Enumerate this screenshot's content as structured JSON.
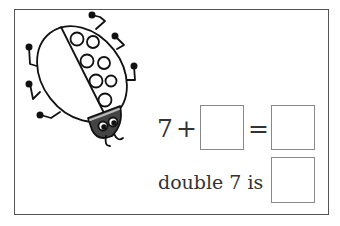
{
  "worksheet": {
    "equation": {
      "addend": "7",
      "plus": "+",
      "equals": "=",
      "answer_box_1": "",
      "answer_box_2": ""
    },
    "doubling": {
      "text": "double 7 is",
      "answer_box": ""
    },
    "illustration": "ladybug",
    "ladybug_spots": 8
  }
}
